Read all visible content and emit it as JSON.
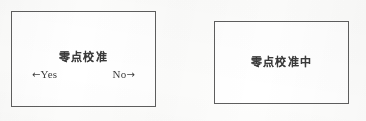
{
  "device_ui": {
    "background_color": "#fdfdfc",
    "border_color": "#5e5e5e",
    "text_color": "#3a3a3a"
  },
  "confirm_screen": {
    "title": "零点校准",
    "yes_arrow": "←",
    "yes_label": "Yes",
    "no_label": "No",
    "no_arrow": "→"
  },
  "progress_screen": {
    "title": "零点校准中"
  }
}
